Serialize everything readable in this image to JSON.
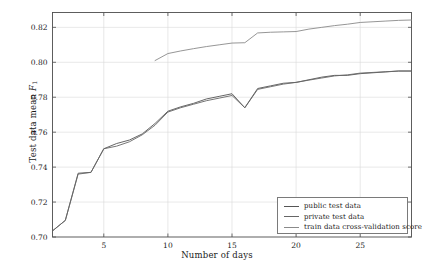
{
  "chart_data": {
    "type": "line",
    "title": "",
    "xlabel": "Number of days",
    "ylabel": "Test data mean F1",
    "ylabel_main": "Test data mean ",
    "ylabel_symbol": "F",
    "ylabel_subscript": "1",
    "xlim": [
      1,
      29
    ],
    "ylim": [
      0.7,
      0.8285
    ],
    "grid": true,
    "legend_position": "lower right",
    "xticks": [
      5,
      10,
      15,
      20,
      25
    ],
    "xtick_labels": [
      "5",
      "10",
      "15",
      "20",
      "25"
    ],
    "yticks": [
      0.7,
      0.72,
      0.74,
      0.76,
      0.78,
      0.8,
      0.82
    ],
    "ytick_labels": [
      "0.70",
      "0.72",
      "0.74",
      "0.76",
      "0.78",
      "0.80",
      "0.82"
    ],
    "x": [
      1,
      2,
      3,
      4,
      5,
      6,
      7,
      8,
      9,
      10,
      11,
      12,
      13,
      14,
      15,
      16,
      17,
      18,
      19,
      20,
      21,
      22,
      23,
      24,
      25,
      26,
      27,
      28,
      29
    ],
    "series": [
      {
        "name": "public test data",
        "color": "#555555",
        "values": [
          0.7035,
          0.7095,
          0.7365,
          0.737,
          0.7505,
          0.7535,
          0.7555,
          0.759,
          0.765,
          0.772,
          0.7745,
          0.7765,
          0.779,
          0.7805,
          0.782,
          0.774,
          0.785,
          0.7865,
          0.788,
          0.7885,
          0.79,
          0.7915,
          0.7925,
          0.7925,
          0.7935,
          0.794,
          0.7945,
          0.795,
          0.795
        ]
      },
      {
        "name": "private test data",
        "color": "#666666",
        "values": [
          0.7035,
          0.7095,
          0.736,
          0.737,
          0.7505,
          0.752,
          0.7545,
          0.7585,
          0.764,
          0.7715,
          0.774,
          0.776,
          0.778,
          0.7795,
          0.781,
          0.774,
          0.7845,
          0.786,
          0.7875,
          0.7885,
          0.7898,
          0.791,
          0.7922,
          0.7928,
          0.7938,
          0.7942,
          0.7946,
          0.795,
          0.795
        ]
      },
      {
        "name": "train data cross-validation score",
        "color": "#8a8a8a",
        "values": [
          null,
          null,
          null,
          null,
          null,
          null,
          null,
          null,
          0.801,
          0.805,
          0.8065,
          0.8078,
          0.809,
          0.81,
          0.811,
          0.8112,
          0.8168,
          0.8172,
          0.8174,
          0.8176,
          0.819,
          0.82,
          0.821,
          0.8218,
          0.8228,
          0.8232,
          0.8236,
          0.824,
          0.8242
        ]
      }
    ]
  },
  "legend": {
    "items": [
      {
        "label": "public test data"
      },
      {
        "label": "private test data"
      },
      {
        "label": "train data cross-validation score"
      }
    ]
  },
  "axes": {
    "frame_color": "#4d4d4d",
    "grid_color": "#d9d9d9"
  }
}
